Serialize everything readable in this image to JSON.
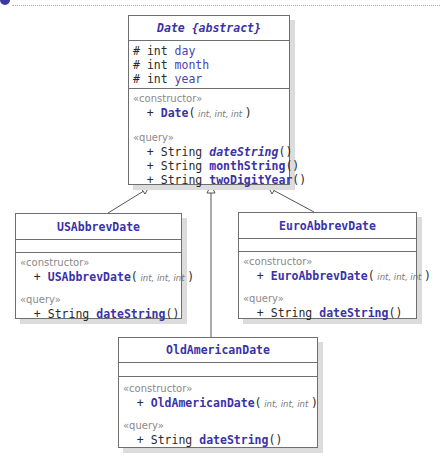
{
  "diagram": {
    "type": "UML class diagram",
    "classes": {
      "date": {
        "name": "Date {abstract}",
        "attributes": [
          {
            "visibility": "#",
            "type": "int",
            "name": "day"
          },
          {
            "visibility": "#",
            "type": "int",
            "name": "month"
          },
          {
            "visibility": "#",
            "type": "int",
            "name": "year"
          }
        ],
        "constructor_stereotype": "«constructor»",
        "constructor": {
          "visibility": "+",
          "name": "Date",
          "open": "(",
          "params": " int, int, int ",
          "close": ")"
        },
        "query_stereotype": "«query»",
        "queries": [
          {
            "visibility": "+",
            "type": "String",
            "name": "dateString",
            "suffix": "()"
          },
          {
            "visibility": "+",
            "type": "String",
            "name": "monthString",
            "suffix": "()"
          },
          {
            "visibility": "+",
            "type": "String",
            "name": "twoDigitYear",
            "suffix": "()"
          }
        ]
      },
      "us": {
        "name": "USAbbrevDate",
        "constructor_stereotype": "«constructor»",
        "constructor": {
          "visibility": "+",
          "name": "USAbbrevDate",
          "open": "(",
          "params": " int, int, int ",
          "close": ")"
        },
        "query_stereotype": "«query»",
        "queries": [
          {
            "visibility": "+",
            "type": "String",
            "name": "dateString",
            "suffix": "()"
          }
        ]
      },
      "euro": {
        "name": "EuroAbbrevDate",
        "constructor_stereotype": "«constructor»",
        "constructor": {
          "visibility": "+",
          "name": "EuroAbbrevDate",
          "open": "(",
          "params": " int, int, int ",
          "close": ")"
        },
        "query_stereotype": "«query»",
        "queries": [
          {
            "visibility": "+",
            "type": "String",
            "name": "dateString",
            "suffix": "()"
          }
        ]
      },
      "oldam": {
        "name": "OldAmericanDate",
        "constructor_stereotype": "«constructor»",
        "constructor": {
          "visibility": "+",
          "name": "OldAmericanDate",
          "open": "(",
          "params": " int, int, int ",
          "close": ")"
        },
        "query_stereotype": "«query»",
        "queries": [
          {
            "visibility": "+",
            "type": "String",
            "name": "dateString",
            "suffix": "()"
          }
        ]
      }
    },
    "relationships": [
      {
        "from": "USAbbrevDate",
        "to": "Date",
        "kind": "generalization"
      },
      {
        "from": "OldAmericanDate",
        "to": "Date",
        "kind": "generalization"
      },
      {
        "from": "EuroAbbrevDate",
        "to": "Date",
        "kind": "generalization"
      }
    ],
    "colors": {
      "class_name": "#3a32a8",
      "border": "#6f6f6f",
      "stereotype": "#8a8a8a",
      "shadow": "#dcdcdc"
    }
  }
}
